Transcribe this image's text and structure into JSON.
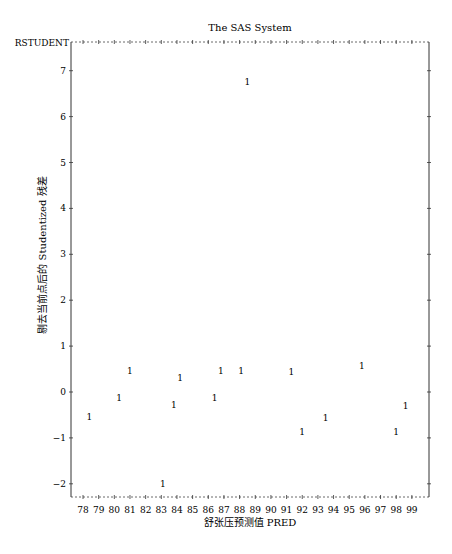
{
  "chart_data": {
    "type": "scatter",
    "title": "The SAS System",
    "xlabel": "舒张压预测值 PRED",
    "ylabel": "剔去当前点后的 Studentized 残差",
    "y_var_name": "RSTUDENT",
    "marker_symbol": "1",
    "xlim": [
      77.3,
      100.3
    ],
    "ylim": [
      -2.3,
      7.55
    ],
    "x_ticks": [
      78,
      79,
      80,
      81,
      82,
      83,
      84,
      85,
      86,
      87,
      88,
      89,
      90,
      91,
      92,
      93,
      94,
      95,
      96,
      97,
      98,
      99
    ],
    "y_ticks": [
      -2,
      -1,
      0,
      1,
      2,
      3,
      4,
      5,
      6,
      7
    ],
    "grid": false,
    "legend": null,
    "points": [
      {
        "x": 78.4,
        "y": -0.55
      },
      {
        "x": 80.3,
        "y": -0.13
      },
      {
        "x": 81.0,
        "y": 0.46
      },
      {
        "x": 83.1,
        "y": -2.0
      },
      {
        "x": 83.8,
        "y": -0.28
      },
      {
        "x": 84.2,
        "y": 0.3
      },
      {
        "x": 86.4,
        "y": -0.13
      },
      {
        "x": 86.8,
        "y": 0.46
      },
      {
        "x": 88.1,
        "y": 0.46
      },
      {
        "x": 88.5,
        "y": 6.76
      },
      {
        "x": 91.3,
        "y": 0.44
      },
      {
        "x": 92.0,
        "y": -0.88
      },
      {
        "x": 93.5,
        "y": -0.57
      },
      {
        "x": 95.8,
        "y": 0.57
      },
      {
        "x": 98.0,
        "y": -0.88
      },
      {
        "x": 98.6,
        "y": -0.3
      }
    ]
  }
}
